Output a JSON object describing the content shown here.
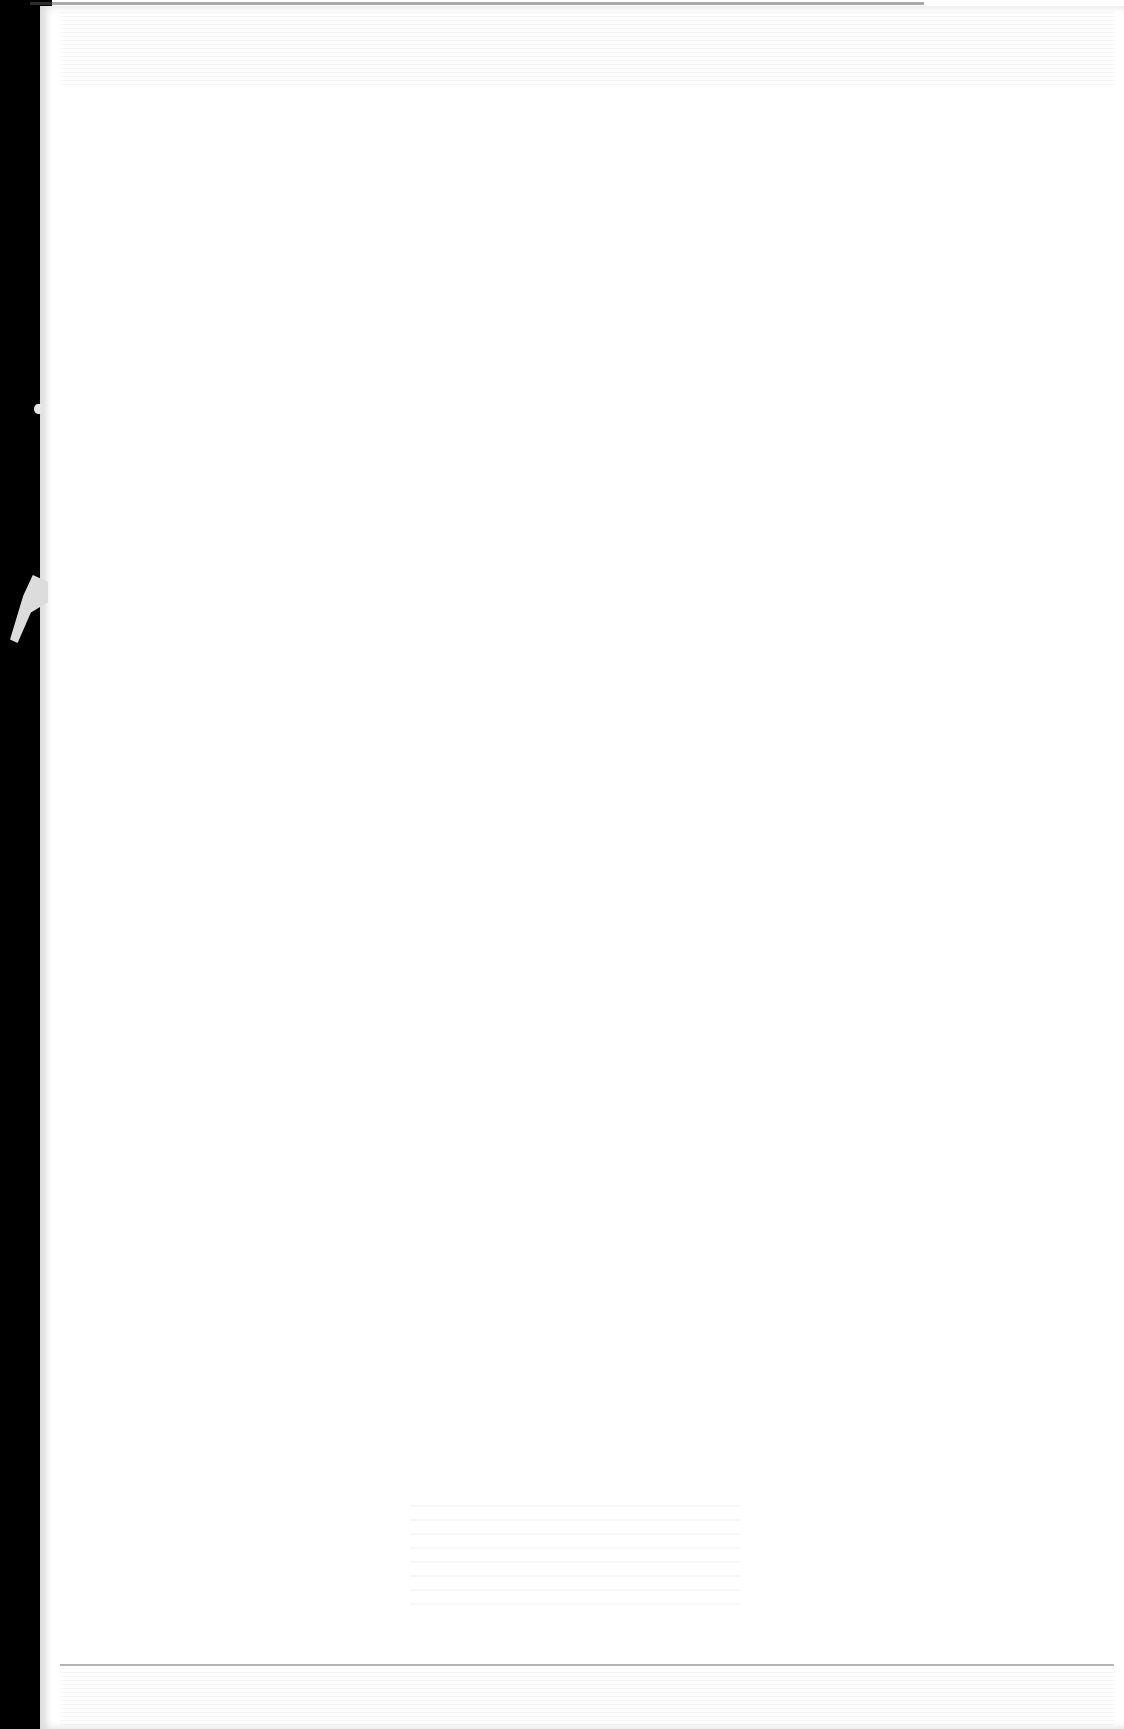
{
  "document": {
    "type": "scanned-blank-page",
    "text": [],
    "colors": {
      "page": "#ffffff",
      "scan_border": "#000000",
      "tear": "#dcdcdc"
    }
  }
}
